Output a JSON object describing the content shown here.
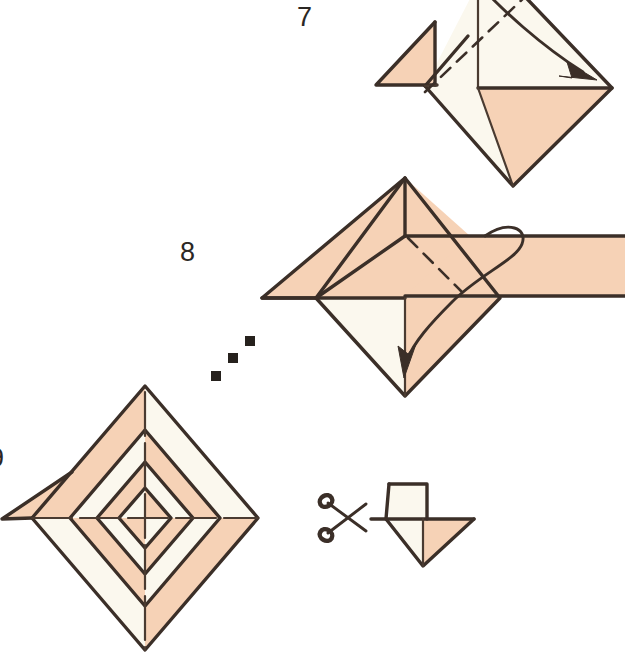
{
  "document": {
    "title": "Origami Folding Diagram",
    "kind": "instructional-illustration",
    "background_color": "#ffffff"
  },
  "palette": {
    "paper_front": "#f6d2b6",
    "paper_back": "#fbf8ee",
    "ink": "#3b2f28",
    "ink_soft": "#4a3b31",
    "number_color": "#2b2724"
  },
  "steps": [
    {
      "id": "step-7",
      "number": "7",
      "label_position": {
        "x": 297,
        "y": 2
      },
      "description": "Diamond with left flap folded out; dashed valley fold with curved arrow pointing down-right"
    },
    {
      "id": "step-8",
      "number": "8",
      "label_position": {
        "x": 180,
        "y": 237
      },
      "description": "Diamond with wide horizontal band across; dashed fold with looping arrow pointing down"
    },
    {
      "id": "step-9",
      "number": "9",
      "label_position": {
        "x": -11,
        "y": 443
      },
      "description": "Concentric nested diamonds with alternating peach and cream quadrants"
    }
  ],
  "ellipsis": {
    "name": "diagonal-dot-separator",
    "dot_count": 3,
    "dots": [
      {
        "x": 216,
        "y": 376
      },
      {
        "x": 232,
        "y": 358
      },
      {
        "x": 248,
        "y": 341
      }
    ],
    "dot_size": 9
  },
  "cut_instruction": {
    "name": "cut-with-scissors",
    "scissors_icon": "scissors-icon",
    "scissors_position": {
      "x": 320,
      "y": 485
    },
    "target_shape": "square-over-inverted-triangle",
    "target_position": {
      "x": 378,
      "y": 480
    }
  },
  "figures": {
    "figure7": {
      "name": "origami-figure-step-7",
      "outer_diamond": {
        "top_x": 490,
        "top_y": -35,
        "left_x": 425,
        "left_y": 85,
        "right_x": 612,
        "right_y": 88,
        "bottom_x": 513,
        "bottom_y": 186
      },
      "left_flap": {
        "apex_x": 435,
        "apex_y": 22,
        "tip_x": 376,
        "tip_y": 84
      },
      "shaded_regions": [
        "left-flap-triangle",
        "lower-right-triangle"
      ],
      "fold_line_style": "dashed",
      "arrow_direction": "down-right"
    },
    "figure8": {
      "name": "origami-figure-step-8",
      "outer_diamond": {
        "top_x": 405,
        "top_y": 178,
        "left_x": 316,
        "left_y": 300,
        "right_x": 500,
        "right_y": 300,
        "bottom_x": 405,
        "bottom_y": 395
      },
      "band": {
        "left_x": 262,
        "right_x": 625,
        "top_y": 236,
        "bottom_y": 296
      },
      "shaded_regions": [
        "upper-band",
        "right-band",
        "lower-right-triangle"
      ],
      "fold_line_style": "dashed",
      "arrow_direction": "down"
    },
    "figure9": {
      "name": "origami-figure-step-9",
      "center": {
        "x": 145,
        "y": 518
      },
      "rings": 4,
      "ring_half_widths": [
        113,
        75,
        48,
        26
      ],
      "ring_half_heights": [
        132,
        88,
        56,
        30
      ],
      "quadrant_colors": [
        "peach",
        "cream",
        "peach",
        "cream"
      ],
      "left_flap_tip": {
        "x": 2,
        "y": 519
      }
    }
  }
}
